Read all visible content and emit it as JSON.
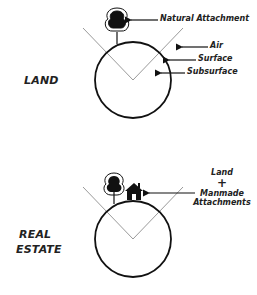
{
  "diagrams": [
    {
      "id": "land",
      "title": "LAND",
      "labels": {
        "natural_attachment": "Natural Attachment",
        "air": "Air",
        "surface": "Surface",
        "subsurface": "Subsurface"
      },
      "icons": [
        "tree-icon"
      ]
    },
    {
      "id": "real-estate",
      "title_line1": "REAL",
      "title_line2": "ESTATE",
      "labels": {
        "land": "Land",
        "plus": "+",
        "manmade_line1": "Manmade",
        "manmade_line2": "Attachments"
      },
      "icons": [
        "tree-icon",
        "house-icon"
      ]
    }
  ],
  "colors": {
    "stroke": "#111111",
    "cone": "#9a9a9a",
    "text": "#222222"
  }
}
